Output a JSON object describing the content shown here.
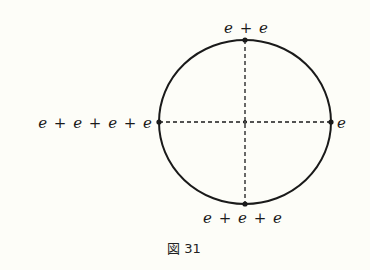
{
  "figure": {
    "caption": "図 31",
    "shape": "circle",
    "colors": {
      "background": "#fdfdf8",
      "stroke": "#1a1a1a"
    },
    "points": {
      "top": {
        "label": "e + e"
      },
      "left": {
        "label": "e + e + e + e"
      },
      "right": {
        "label": "e"
      },
      "bottom": {
        "label": "e + e + e"
      }
    },
    "axes": {
      "horizontal": "dashed",
      "vertical": "dashed"
    }
  }
}
